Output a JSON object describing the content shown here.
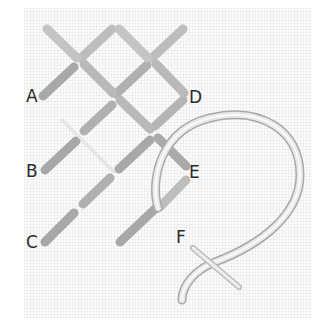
{
  "diagram": {
    "type": "cross-stitch-instruction",
    "labels": [
      {
        "id": "A",
        "text": "A",
        "x": 26,
        "y": 88
      },
      {
        "id": "B",
        "text": "B",
        "x": 26,
        "y": 163
      },
      {
        "id": "C",
        "text": "C",
        "x": 26,
        "y": 234
      },
      {
        "id": "D",
        "text": "D",
        "x": 189,
        "y": 89
      },
      {
        "id": "E",
        "text": "E",
        "x": 189,
        "y": 164
      },
      {
        "id": "F",
        "text": "F",
        "x": 176,
        "y": 229
      }
    ],
    "colors": {
      "thread_light": "#e6e6e6",
      "thread_dark": "#9a9a9a",
      "label": "#2b2b2b",
      "cloth": "#fbfbfb"
    }
  }
}
